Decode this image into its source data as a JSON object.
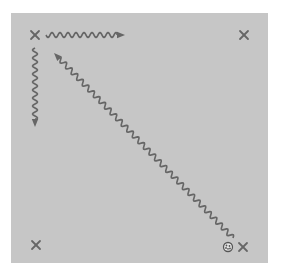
{
  "diagram": {
    "title": "",
    "colors": {
      "background": "#ffffff",
      "field": "#c6c6c6",
      "stroke": "#666666",
      "ball_fill": "#e8e8e8",
      "ball_stroke": "#555555"
    },
    "markers": [
      {
        "id": "top-left",
        "icon": "cross-icon",
        "label": "top-left position"
      },
      {
        "id": "top-right",
        "icon": "cross-icon",
        "label": "top-right position"
      },
      {
        "id": "bottom-left",
        "icon": "cross-icon",
        "label": "bottom-left position"
      },
      {
        "id": "bottom-right",
        "icon": "cross-icon",
        "label": "bottom-right position"
      }
    ],
    "ball": {
      "icon": "ball-icon",
      "at": "bottom-right"
    },
    "paths": [
      {
        "id": "top-left-to-right",
        "from": "top-left",
        "to": "top-right",
        "style": "wavy-arrow"
      },
      {
        "id": "top-left-down",
        "from": "top-left",
        "to": "bottom-left",
        "style": "wavy-arrow"
      },
      {
        "id": "diagonal-bottom-right-to-top-left",
        "from": "bottom-right",
        "to": "top-left",
        "style": "wavy-arrow"
      }
    ]
  }
}
